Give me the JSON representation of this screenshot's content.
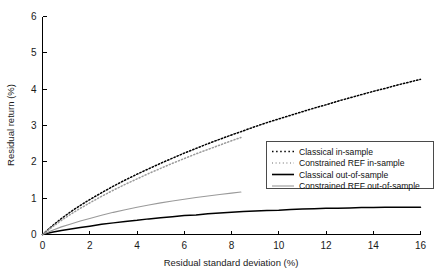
{
  "chart_data": {
    "type": "line",
    "title": "",
    "xlabel": "Residual standard deviation (%)",
    "ylabel": "Residual return (%)",
    "xlim": [
      0,
      16
    ],
    "ylim": [
      0,
      6
    ],
    "xticks": [
      0,
      2,
      4,
      6,
      8,
      10,
      12,
      14,
      16
    ],
    "yticks": [
      0,
      1,
      2,
      3,
      4,
      5,
      6
    ],
    "grid": false,
    "legend_position": "lower-right",
    "series": [
      {
        "name": "Classical in-sample",
        "style": "dotted",
        "color": "#000000",
        "x": [
          0,
          0.4,
          0.8,
          1.2,
          1.6,
          2.0,
          2.5,
          3.0,
          3.5,
          4.0,
          4.5,
          5.0,
          5.5,
          6.0,
          6.5,
          7.0,
          7.5,
          8.0,
          8.4,
          9.0,
          9.5,
          10.0,
          10.5,
          11.0,
          11.5,
          12.0,
          12.5,
          13.0,
          13.5,
          14.0,
          14.5,
          15.0,
          15.5,
          16.0
        ],
        "y": [
          0,
          0.23,
          0.44,
          0.63,
          0.8,
          0.96,
          1.15,
          1.33,
          1.5,
          1.66,
          1.81,
          1.96,
          2.1,
          2.24,
          2.37,
          2.5,
          2.62,
          2.74,
          2.83,
          2.97,
          3.08,
          3.18,
          3.28,
          3.38,
          3.48,
          3.57,
          3.67,
          3.76,
          3.85,
          3.94,
          4.02,
          4.11,
          4.19,
          4.27
        ]
      },
      {
        "name": "Constrained REF in-sample",
        "style": "dotted",
        "color": "#9a9a9a",
        "x": [
          0,
          0.4,
          0.8,
          1.2,
          1.6,
          2.0,
          2.5,
          3.0,
          3.5,
          4.0,
          4.5,
          5.0,
          5.5,
          6.0,
          6.5,
          7.0,
          7.5,
          8.0,
          8.4
        ],
        "y": [
          0,
          0.2,
          0.39,
          0.56,
          0.72,
          0.87,
          1.05,
          1.22,
          1.38,
          1.53,
          1.68,
          1.82,
          1.96,
          2.09,
          2.22,
          2.34,
          2.46,
          2.58,
          2.67
        ]
      },
      {
        "name": "Classical out-of-sample",
        "style": "solid",
        "color": "#000000",
        "x": [
          0,
          0.4,
          0.8,
          1.2,
          1.6,
          2.0,
          2.5,
          3.0,
          3.5,
          4.0,
          4.5,
          5.0,
          5.5,
          6.0,
          6.5,
          7.0,
          7.5,
          8.0,
          8.5,
          9.0,
          9.5,
          10.0,
          10.5,
          11.0,
          11.5,
          12.0,
          12.5,
          13.0,
          13.5,
          14.0,
          14.5,
          15.0,
          15.5,
          16.0
        ],
        "y": [
          0,
          0.06,
          0.11,
          0.15,
          0.19,
          0.23,
          0.28,
          0.32,
          0.36,
          0.39,
          0.43,
          0.46,
          0.49,
          0.52,
          0.54,
          0.57,
          0.59,
          0.61,
          0.63,
          0.65,
          0.66,
          0.67,
          0.69,
          0.7,
          0.71,
          0.72,
          0.72,
          0.73,
          0.74,
          0.74,
          0.75,
          0.75,
          0.75,
          0.75
        ]
      },
      {
        "name": "Constrained REF out-of-sample",
        "style": "solid",
        "color": "#9a9a9a",
        "x": [
          0,
          0.4,
          0.8,
          1.2,
          1.6,
          2.0,
          2.5,
          3.0,
          3.5,
          4.0,
          4.5,
          5.0,
          5.5,
          6.0,
          6.5,
          7.0,
          7.5,
          8.0,
          8.4
        ],
        "y": [
          0,
          0.11,
          0.21,
          0.29,
          0.37,
          0.44,
          0.53,
          0.61,
          0.68,
          0.75,
          0.81,
          0.87,
          0.92,
          0.97,
          1.02,
          1.06,
          1.1,
          1.14,
          1.17
        ]
      }
    ]
  },
  "axes": {
    "x_label": "Residual standard deviation (%)",
    "y_label": "Residual return (%)",
    "x_tick_labels": [
      "0",
      "2",
      "4",
      "6",
      "8",
      "10",
      "12",
      "14",
      "16"
    ],
    "y_tick_labels": [
      "0",
      "1",
      "2",
      "3",
      "4",
      "5",
      "6"
    ]
  },
  "legend": {
    "entries": [
      {
        "label": "Classical in-sample"
      },
      {
        "label": "Constrained REF in-sample"
      },
      {
        "label": "Classical out-of-sample"
      },
      {
        "label": "Constrained REF out-of-sample"
      }
    ]
  }
}
